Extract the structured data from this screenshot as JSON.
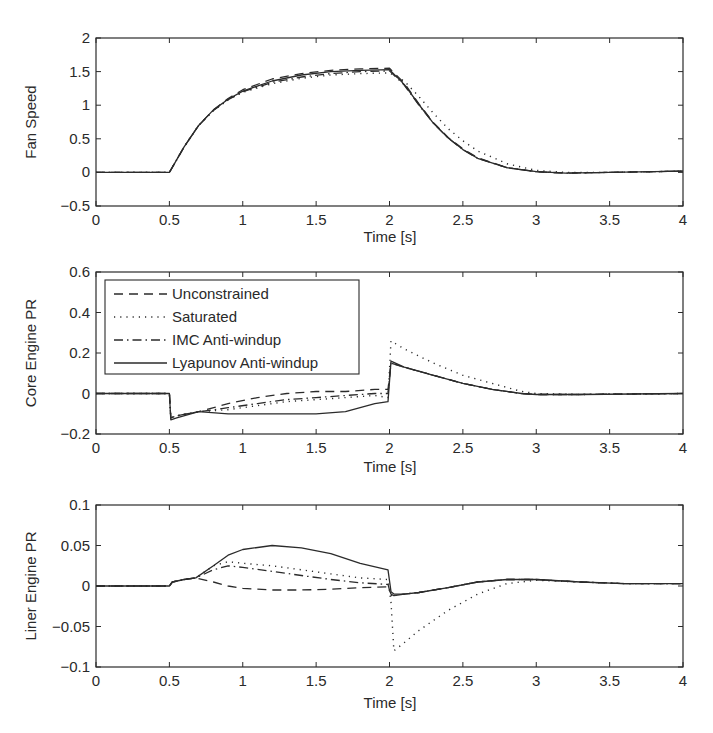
{
  "figure": {
    "xlabel": "Time [s]",
    "legend": {
      "entries": [
        {
          "label": "Unconstrained",
          "style": "dashed"
        },
        {
          "label": "Saturated",
          "style": "dotted"
        },
        {
          "label": "IMC Anti-windup",
          "style": "dashdot"
        },
        {
          "label": "Lyapunov Anti-windup",
          "style": "solid"
        }
      ]
    },
    "line_color": "#2b2b2b"
  },
  "chart_data": [
    {
      "type": "line",
      "title": "",
      "xlabel": "Time [s]",
      "ylabel": "Fan Speed",
      "xlim": [
        0,
        4
      ],
      "ylim": [
        -0.5,
        2
      ],
      "xticks": [
        "0",
        "0.5",
        "1",
        "1.5",
        "2",
        "2.5",
        "3",
        "3.5",
        "4"
      ],
      "yticks": [
        "-0.5",
        "0",
        "0.5",
        "1",
        "1.5",
        "2"
      ],
      "grid": false,
      "x": [
        0,
        0.5,
        0.6,
        0.7,
        0.8,
        0.9,
        1.0,
        1.2,
        1.4,
        1.6,
        1.8,
        2.0,
        2.1,
        2.2,
        2.3,
        2.4,
        2.5,
        2.6,
        2.8,
        3.0,
        3.2,
        3.5,
        4.0
      ],
      "series": [
        {
          "name": "Unconstrained",
          "values": [
            0,
            0,
            0.38,
            0.7,
            0.93,
            1.1,
            1.23,
            1.39,
            1.47,
            1.52,
            1.54,
            1.55,
            1.33,
            1.02,
            0.74,
            0.52,
            0.35,
            0.22,
            0.07,
            0.01,
            -0.01,
            0.0,
            0.02
          ]
        },
        {
          "name": "Saturated",
          "values": [
            0,
            0,
            0.38,
            0.7,
            0.92,
            1.08,
            1.19,
            1.32,
            1.4,
            1.45,
            1.47,
            1.48,
            1.36,
            1.13,
            0.88,
            0.65,
            0.47,
            0.32,
            0.13,
            0.03,
            0.0,
            0.0,
            0.02
          ]
        },
        {
          "name": "IMC Anti-windup",
          "values": [
            0,
            0,
            0.38,
            0.7,
            0.92,
            1.08,
            1.2,
            1.34,
            1.42,
            1.47,
            1.5,
            1.51,
            1.3,
            1.0,
            0.73,
            0.51,
            0.34,
            0.21,
            0.07,
            0.01,
            -0.01,
            0.0,
            0.02
          ]
        },
        {
          "name": "Lyapunov Anti-windup",
          "values": [
            0,
            0,
            0.38,
            0.7,
            0.93,
            1.09,
            1.21,
            1.36,
            1.45,
            1.5,
            1.52,
            1.53,
            1.31,
            1.01,
            0.73,
            0.51,
            0.34,
            0.21,
            0.07,
            0.01,
            -0.01,
            0.0,
            0.02
          ]
        }
      ]
    },
    {
      "type": "line",
      "title": "",
      "xlabel": "Time [s]",
      "ylabel": "Core Engine PR",
      "xlim": [
        0,
        4
      ],
      "ylim": [
        -0.2,
        0.6
      ],
      "xticks": [
        "0",
        "0.5",
        "1",
        "1.5",
        "2",
        "2.5",
        "3",
        "3.5",
        "4"
      ],
      "yticks": [
        "-0.2",
        "0",
        "0.2",
        "0.4",
        "0.6"
      ],
      "grid": false,
      "legend_position": "upper left",
      "x": [
        0,
        0.5,
        0.51,
        0.55,
        0.7,
        0.9,
        1.1,
        1.3,
        1.5,
        1.7,
        1.9,
        1.99,
        2.01,
        2.1,
        2.3,
        2.5,
        2.7,
        2.9,
        3.0,
        3.3,
        4.0
      ],
      "series": [
        {
          "name": "Unconstrained",
          "values": [
            0,
            0,
            -0.12,
            -0.11,
            -0.09,
            -0.05,
            -0.02,
            0.0,
            0.01,
            0.01,
            0.02,
            0.02,
            0.15,
            0.13,
            0.09,
            0.05,
            0.02,
            0.0,
            -0.005,
            -0.005,
            0.0
          ]
        },
        {
          "name": "Saturated",
          "values": [
            0,
            0,
            -0.12,
            -0.11,
            -0.09,
            -0.08,
            -0.06,
            -0.04,
            -0.03,
            -0.02,
            -0.01,
            -0.02,
            0.26,
            0.22,
            0.15,
            0.09,
            0.05,
            0.01,
            0.0,
            -0.005,
            0.0
          ]
        },
        {
          "name": "IMC Anti-windup",
          "values": [
            0,
            0,
            -0.12,
            -0.11,
            -0.09,
            -0.07,
            -0.05,
            -0.03,
            -0.02,
            -0.01,
            0.0,
            0.0,
            0.15,
            0.13,
            0.09,
            0.05,
            0.02,
            0.0,
            -0.005,
            -0.005,
            0.0
          ]
        },
        {
          "name": "Lyapunov Anti-windup",
          "values": [
            0,
            0,
            -0.13,
            -0.12,
            -0.09,
            -0.1,
            -0.1,
            -0.1,
            -0.1,
            -0.09,
            -0.05,
            -0.04,
            0.16,
            0.13,
            0.09,
            0.05,
            0.02,
            0.0,
            -0.005,
            -0.005,
            0.0
          ]
        }
      ]
    },
    {
      "type": "line",
      "title": "",
      "xlabel": "Time [s]",
      "ylabel": "Liner Engine PR",
      "xlim": [
        0,
        4
      ],
      "ylim": [
        -0.1,
        0.1
      ],
      "xticks": [
        "0",
        "0.5",
        "1",
        "1.5",
        "2",
        "2.5",
        "3",
        "3.5",
        "4"
      ],
      "yticks": [
        "-0.1",
        "-0.05",
        "0",
        "0.05",
        "0.1"
      ],
      "grid": false,
      "x": [
        0,
        0.5,
        0.52,
        0.6,
        0.68,
        0.8,
        0.9,
        1.0,
        1.2,
        1.4,
        1.6,
        1.8,
        1.99,
        2.01,
        2.03,
        2.1,
        2.2,
        2.4,
        2.6,
        2.8,
        3.0,
        3.3,
        3.6,
        4.0
      ],
      "series": [
        {
          "name": "Unconstrained",
          "values": [
            0,
            0,
            0.005,
            0.008,
            0.01,
            0.005,
            0.0,
            -0.003,
            -0.005,
            -0.005,
            -0.004,
            -0.002,
            -0.001,
            -0.01,
            -0.012,
            -0.01,
            -0.008,
            -0.002,
            0.005,
            0.008,
            0.008,
            0.005,
            0.003,
            0.003
          ]
        },
        {
          "name": "Saturated",
          "values": [
            0,
            0,
            0.005,
            0.008,
            0.01,
            0.025,
            0.03,
            0.028,
            0.025,
            0.02,
            0.015,
            0.01,
            0.008,
            -0.02,
            -0.08,
            -0.07,
            -0.055,
            -0.03,
            -0.01,
            0.003,
            0.007,
            0.005,
            0.003,
            0.003
          ]
        },
        {
          "name": "IMC Anti-windup",
          "values": [
            0,
            0,
            0.005,
            0.008,
            0.01,
            0.02,
            0.025,
            0.023,
            0.018,
            0.013,
            0.008,
            0.004,
            0.002,
            -0.012,
            -0.012,
            -0.01,
            -0.008,
            -0.002,
            0.005,
            0.008,
            0.008,
            0.005,
            0.003,
            0.003
          ]
        },
        {
          "name": "Lyapunov Anti-windup",
          "values": [
            0,
            0,
            0.005,
            0.008,
            0.01,
            0.025,
            0.038,
            0.045,
            0.05,
            0.047,
            0.04,
            0.028,
            0.02,
            -0.007,
            -0.01,
            -0.01,
            -0.008,
            -0.002,
            0.005,
            0.008,
            0.008,
            0.005,
            0.003,
            0.003
          ]
        }
      ]
    }
  ]
}
